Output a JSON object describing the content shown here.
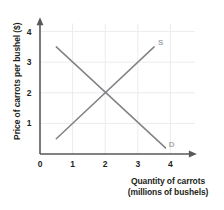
{
  "chart_data": {
    "type": "line",
    "title": "",
    "xlabel": "Quantity of carrots (millions of bushels)",
    "ylabel": "Price of carrots per bushel ($)",
    "xlabel_line1": "Quantity of carrots",
    "xlabel_line2": "(millions of bushels)",
    "xlim": [
      0,
      4.75
    ],
    "ylim": [
      0,
      4.4
    ],
    "xticks": [
      "0",
      "1",
      "2",
      "3",
      "4"
    ],
    "xtick_values": [
      0,
      1,
      2,
      3,
      4
    ],
    "yticks": [
      "1",
      "2",
      "3",
      "4"
    ],
    "ytick_values": [
      1,
      2,
      3,
      4
    ],
    "origin_label": "0",
    "grid": true,
    "legend": "none",
    "series": [
      {
        "name": "S",
        "label": "S",
        "description": "Supply curve, upward sloping",
        "points": [
          [
            0.5,
            0.5
          ],
          [
            3.5,
            3.5
          ]
        ],
        "color": "#808285",
        "label_x": 3.62,
        "label_y": 3.62
      },
      {
        "name": "D",
        "label": "D",
        "description": "Demand curve, downward sloping",
        "points": [
          [
            0.5,
            3.5
          ],
          [
            3.85,
            0.2
          ]
        ],
        "color": "#808285",
        "label_x": 3.95,
        "label_y": 0.3
      }
    ],
    "equilibrium": {
      "quantity": 2,
      "price": 2
    },
    "colors": {
      "axis": "#58595b",
      "grid": "#ececed",
      "curve": "#808285",
      "curve_label": "#a6a8ab",
      "text": "#231f20",
      "background": "#ffffff"
    }
  }
}
